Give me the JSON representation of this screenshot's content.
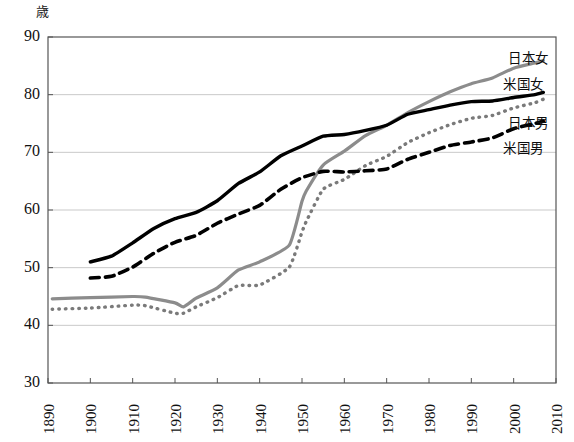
{
  "chart_data": {
    "type": "line",
    "title": "",
    "subtitle": "",
    "xlabel": "",
    "ylabel": "歳",
    "ylim": [
      30,
      90
    ],
    "xlim": [
      1890,
      2010
    ],
    "yticks": [
      30,
      40,
      50,
      60,
      70,
      80,
      90
    ],
    "xticks": [
      1890,
      1900,
      1910,
      1920,
      1930,
      1940,
      1950,
      1960,
      1970,
      1980,
      1990,
      2000,
      2010
    ],
    "grid": true,
    "legend_position": "right-inline",
    "series": [
      {
        "name": "日本女",
        "style": "solid",
        "color": "#8c8c8c",
        "width": 3.2,
        "x": [
          1891,
          1900,
          1910,
          1913,
          1920,
          1922,
          1925,
          1930,
          1935,
          1940,
          1947,
          1950,
          1951,
          1955,
          1960,
          1965,
          1970,
          1975,
          1980,
          1985,
          1990,
          1995,
          2000,
          2005,
          2007
        ],
        "values": [
          44.6,
          44.8,
          45.0,
          44.9,
          43.9,
          43.2,
          44.7,
          46.5,
          49.6,
          51.0,
          53.9,
          61.5,
          63.3,
          67.8,
          70.2,
          72.9,
          74.7,
          76.9,
          78.8,
          80.5,
          81.9,
          82.9,
          84.6,
          85.5,
          85.9
        ]
      },
      {
        "name": "米国女",
        "style": "solid",
        "color": "#000000",
        "width": 3.4,
        "x": [
          1900,
          1905,
          1910,
          1915,
          1920,
          1925,
          1930,
          1935,
          1940,
          1945,
          1950,
          1955,
          1960,
          1965,
          1970,
          1975,
          1980,
          1985,
          1990,
          1995,
          2000,
          2005,
          2007
        ],
        "values": [
          51.0,
          52.0,
          54.3,
          56.8,
          58.5,
          59.6,
          61.6,
          64.6,
          66.6,
          69.4,
          71.1,
          72.8,
          73.1,
          73.8,
          74.7,
          76.6,
          77.4,
          78.2,
          78.8,
          78.9,
          79.5,
          80.0,
          80.4
        ]
      },
      {
        "name": "日本男",
        "style": "dotted",
        "color": "#7a7a7a",
        "width": 3.4,
        "x": [
          1891,
          1900,
          1910,
          1913,
          1920,
          1922,
          1925,
          1930,
          1935,
          1940,
          1947,
          1950,
          1951,
          1955,
          1960,
          1965,
          1970,
          1975,
          1980,
          1985,
          1990,
          1995,
          2000,
          2005,
          2007
        ],
        "values": [
          42.8,
          43.0,
          43.5,
          43.4,
          42.1,
          42.1,
          43.2,
          44.8,
          46.9,
          47.0,
          50.1,
          56.2,
          58.0,
          63.6,
          65.3,
          67.7,
          69.3,
          71.7,
          73.4,
          74.8,
          75.9,
          76.4,
          77.7,
          78.6,
          79.2
        ]
      },
      {
        "name": "米国男",
        "style": "dashed",
        "color": "#000000",
        "width": 3.6,
        "x": [
          1900,
          1905,
          1910,
          1915,
          1920,
          1925,
          1930,
          1935,
          1940,
          1945,
          1950,
          1955,
          1960,
          1965,
          1970,
          1975,
          1980,
          1985,
          1990,
          1995,
          2000,
          2005,
          2007
        ],
        "values": [
          48.2,
          48.5,
          50.1,
          52.5,
          54.4,
          55.6,
          57.7,
          59.3,
          60.8,
          63.6,
          65.6,
          66.7,
          66.6,
          66.8,
          67.1,
          68.8,
          70.0,
          71.2,
          71.8,
          72.5,
          74.1,
          75.0,
          75.4
        ]
      }
    ],
    "annotations": [
      {
        "text": "日本女",
        "series": "日本女",
        "x_px": 508,
        "y_px": 47
      },
      {
        "text": "米国女",
        "series": "米国女",
        "x_px": 503,
        "y_px": 73
      },
      {
        "text": "日本男",
        "series": "日本男",
        "x_px": 508,
        "y_px": 112
      },
      {
        "text": "米国男",
        "series": "米国男",
        "x_px": 503,
        "y_px": 137
      }
    ]
  },
  "axes": {
    "unit_label": "歳",
    "y_tick_labels": [
      "90",
      "80",
      "70",
      "60",
      "50",
      "40",
      "30"
    ],
    "x_tick_labels": [
      "1890",
      "1900",
      "1910",
      "1920",
      "1930",
      "1940",
      "1950",
      "1960",
      "1970",
      "1980",
      "1990",
      "2000",
      "2010"
    ]
  },
  "colors": {
    "background": "#ffffff",
    "axis": "#555555",
    "grid": "#c9c9c9",
    "japan_female": "#8c8c8c",
    "us_female": "#000000",
    "japan_male": "#7a7a7a",
    "us_male": "#000000"
  }
}
